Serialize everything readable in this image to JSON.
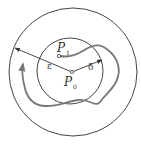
{
  "diagram": {
    "labels": {
      "p1": {
        "main": "P",
        "sub": "1"
      },
      "p0": {
        "main": "P",
        "sub": "0"
      },
      "epsilon": "ε",
      "delta": "δ"
    },
    "colors": {
      "circle": "#444444",
      "trajectory": "#777777",
      "text": "#333333"
    }
  }
}
